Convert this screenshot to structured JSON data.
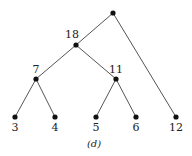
{
  "diagram": {
    "type": "binary-tree",
    "caption": "(d)",
    "nodes": [
      {
        "id": "root",
        "label": "",
        "x": 113,
        "y": 13
      },
      {
        "id": "n18",
        "label": "18",
        "x": 76,
        "y": 45
      },
      {
        "id": "n7",
        "label": "7",
        "x": 36,
        "y": 79
      },
      {
        "id": "n11",
        "label": "11",
        "x": 116,
        "y": 79
      },
      {
        "id": "n3",
        "label": "3",
        "x": 15,
        "y": 117
      },
      {
        "id": "n4",
        "label": "4",
        "x": 55,
        "y": 117
      },
      {
        "id": "n5",
        "label": "5",
        "x": 96,
        "y": 117
      },
      {
        "id": "n6",
        "label": "6",
        "x": 136,
        "y": 117
      },
      {
        "id": "n12",
        "label": "12",
        "x": 176,
        "y": 117
      }
    ],
    "edges": [
      [
        "root",
        "n18"
      ],
      [
        "root",
        "n12"
      ],
      [
        "n18",
        "n7"
      ],
      [
        "n18",
        "n11"
      ],
      [
        "n7",
        "n3"
      ],
      [
        "n7",
        "n4"
      ],
      [
        "n11",
        "n5"
      ],
      [
        "n11",
        "n6"
      ]
    ]
  }
}
